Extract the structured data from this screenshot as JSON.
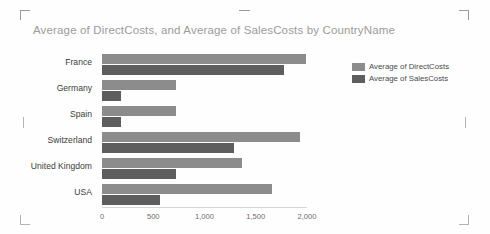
{
  "visual": {
    "title": "Average of DirectCosts, and Average of SalesCosts by CountryName",
    "handles": {
      "top_left": "resize-handle",
      "top_right": "resize-handle",
      "bottom_left": "resize-handle",
      "bottom_right": "resize-handle"
    }
  },
  "colors": {
    "series_direct": "#8c8c8c",
    "series_sales": "#5e5e5e",
    "title_text": "#9b9b9b",
    "axis_text": "#6b6b6b",
    "category_text": "#3b3b3b"
  },
  "legend": {
    "position": "right",
    "items": [
      {
        "label": "Average of DirectCosts",
        "color": "#8c8c8c"
      },
      {
        "label": "Average of SalesCosts",
        "color": "#5e5e5e"
      }
    ]
  },
  "chart_data": {
    "type": "bar",
    "orientation": "horizontal",
    "title": "Average of DirectCosts, and Average of SalesCosts by CountryName",
    "xlabel": "",
    "ylabel": "",
    "categories": [
      "France",
      "Germany",
      "Spain",
      "Switzerland",
      "United Kingdom",
      "USA"
    ],
    "series": [
      {
        "name": "Average of DirectCosts",
        "color": "#8c8c8c",
        "values": [
          1990,
          720,
          720,
          1930,
          1370,
          1660
        ]
      },
      {
        "name": "Average of SalesCosts",
        "color": "#5e5e5e",
        "values": [
          1780,
          190,
          190,
          1290,
          720,
          570
        ]
      }
    ],
    "xlim": [
      0,
      2000
    ],
    "xticks": [
      0,
      500,
      1000,
      1500,
      2000
    ],
    "xtick_labels": [
      "0",
      "500",
      "1,000",
      "1,500",
      "2,000"
    ],
    "grid": false,
    "legend_position": "right"
  }
}
